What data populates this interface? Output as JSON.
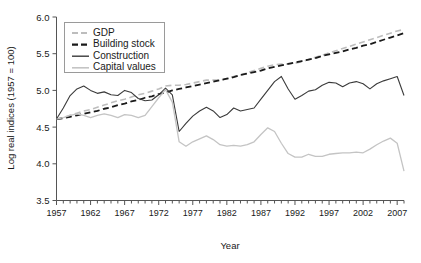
{
  "chart_data": {
    "type": "line",
    "title": "",
    "xlabel": "Year",
    "ylabel": "Log real indices (1957 = 100)",
    "xlim": [
      1957,
      2008
    ],
    "ylim": [
      3.5,
      6.0
    ],
    "ytick_labels": [
      "6.0",
      "5.5",
      "5.0",
      "4.5",
      "4.0",
      "3.5"
    ],
    "ytick_values": [
      6.0,
      5.5,
      5.0,
      4.5,
      4.0,
      3.5
    ],
    "xtick_labels": [
      "1957",
      "1962",
      "1967",
      "1972",
      "1977",
      "1982",
      "1987",
      "1992",
      "1997",
      "2002",
      "2007"
    ],
    "xtick_values": [
      1957,
      1962,
      1967,
      1972,
      1977,
      1982,
      1987,
      1992,
      1997,
      2002,
      2007
    ],
    "minor_xticks_every": 1,
    "grid": false,
    "legend_position": "top-left",
    "x": [
      1957,
      1958,
      1959,
      1960,
      1961,
      1962,
      1963,
      1964,
      1965,
      1966,
      1967,
      1968,
      1969,
      1970,
      1971,
      1972,
      1973,
      1974,
      1975,
      1976,
      1977,
      1978,
      1979,
      1980,
      1981,
      1982,
      1983,
      1984,
      1985,
      1986,
      1987,
      1988,
      1989,
      1990,
      1991,
      1992,
      1993,
      1994,
      1995,
      1996,
      1997,
      1998,
      1999,
      2000,
      2001,
      2002,
      2003,
      2004,
      2005,
      2006,
      2007,
      2008
    ],
    "series": [
      {
        "name": "GDP",
        "color": "#bdbdbd",
        "style": "dashed",
        "width": 1.6,
        "values": [
          4.61,
          4.63,
          4.66,
          4.69,
          4.72,
          4.74,
          4.77,
          4.8,
          4.83,
          4.86,
          4.88,
          4.91,
          4.94,
          4.96,
          4.99,
          5.02,
          5.06,
          5.07,
          5.07,
          5.08,
          5.1,
          5.12,
          5.14,
          5.14,
          5.14,
          5.16,
          5.19,
          5.21,
          5.24,
          5.27,
          5.3,
          5.33,
          5.35,
          5.36,
          5.36,
          5.37,
          5.39,
          5.42,
          5.45,
          5.48,
          5.51,
          5.54,
          5.57,
          5.6,
          5.63,
          5.66,
          5.69,
          5.72,
          5.75,
          5.78,
          5.81,
          5.83
        ]
      },
      {
        "name": "Building stock",
        "color": "#1a1a1a",
        "style": "dashed",
        "width": 1.8,
        "values": [
          4.61,
          4.62,
          4.64,
          4.66,
          4.68,
          4.7,
          4.72,
          4.75,
          4.77,
          4.8,
          4.82,
          4.85,
          4.87,
          4.9,
          4.92,
          4.95,
          4.97,
          5.0,
          5.02,
          5.04,
          5.06,
          5.08,
          5.1,
          5.12,
          5.14,
          5.16,
          5.18,
          5.21,
          5.23,
          5.25,
          5.27,
          5.3,
          5.32,
          5.34,
          5.36,
          5.38,
          5.4,
          5.42,
          5.44,
          5.47,
          5.49,
          5.51,
          5.53,
          5.56,
          5.58,
          5.61,
          5.63,
          5.66,
          5.69,
          5.72,
          5.75,
          5.78
        ]
      },
      {
        "name": "Construction",
        "color": "#3a3a3a",
        "style": "solid",
        "width": 1.1,
        "values": [
          4.61,
          4.76,
          4.93,
          5.02,
          5.06,
          5.0,
          4.96,
          4.98,
          4.94,
          4.93,
          5.0,
          4.97,
          4.89,
          4.86,
          4.87,
          4.94,
          5.03,
          4.94,
          4.44,
          4.55,
          4.65,
          4.72,
          4.77,
          4.72,
          4.63,
          4.67,
          4.76,
          4.72,
          4.74,
          4.76,
          4.88,
          5.0,
          5.12,
          5.19,
          5.02,
          4.88,
          4.93,
          4.99,
          5.01,
          5.07,
          5.11,
          5.1,
          5.05,
          5.1,
          5.12,
          5.09,
          5.02,
          5.09,
          5.13,
          5.16,
          5.19,
          4.93
        ]
      },
      {
        "name": "Capital values",
        "color": "#c4c4c4",
        "style": "solid",
        "width": 1.3,
        "values": [
          4.61,
          4.63,
          4.66,
          4.68,
          4.66,
          4.63,
          4.66,
          4.68,
          4.66,
          4.63,
          4.67,
          4.66,
          4.63,
          4.66,
          4.78,
          4.9,
          5.01,
          4.84,
          4.3,
          4.24,
          4.3,
          4.34,
          4.38,
          4.33,
          4.26,
          4.24,
          4.25,
          4.24,
          4.26,
          4.3,
          4.4,
          4.49,
          4.44,
          4.28,
          4.14,
          4.09,
          4.09,
          4.13,
          4.1,
          4.1,
          4.13,
          4.14,
          4.15,
          4.15,
          4.16,
          4.15,
          4.2,
          4.26,
          4.31,
          4.35,
          4.28,
          3.9
        ]
      }
    ]
  },
  "legend": {
    "items": [
      {
        "label": "GDP"
      },
      {
        "label": "Building stock"
      },
      {
        "label": "Construction"
      },
      {
        "label": "Capital values"
      }
    ]
  }
}
